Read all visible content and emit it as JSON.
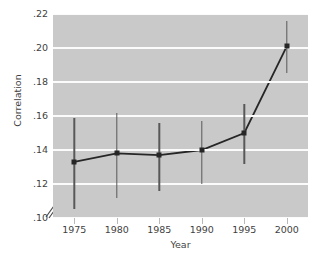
{
  "chart_data": {
    "type": "line",
    "title": "",
    "xlabel": "Year",
    "ylabel": "Correlation",
    "x": [
      1975,
      1980,
      1985,
      1990,
      1995,
      2000
    ],
    "xticklabels": [
      "1975",
      "1980",
      "1985",
      "1990",
      "1995",
      "2000"
    ],
    "yticks": [
      0.1,
      0.12,
      0.14,
      0.16,
      0.18,
      0.2,
      0.22
    ],
    "yticklabels": [
      ".10",
      ".12",
      ".14",
      ".16",
      ".18",
      ".20",
      ".22"
    ],
    "xlim": [
      1972.5,
      2002.5
    ],
    "ylim": [
      0.1,
      0.22
    ],
    "grid": "horizontal",
    "legend": "none",
    "axis_break": "y-axis break below .10",
    "series": [
      {
        "name": "Correlation",
        "marker": "square",
        "color": "#262626",
        "values": [
          0.133,
          0.138,
          0.137,
          0.14,
          0.15,
          0.201
        ],
        "error_low": [
          0.105,
          0.112,
          0.116,
          0.12,
          0.132,
          0.185
        ],
        "error_high": [
          0.159,
          0.162,
          0.156,
          0.157,
          0.167,
          0.216
        ]
      }
    ],
    "panel_color": "#c9c9c9",
    "gridline_color": "#fbfbfb",
    "error_bar_color": "#585858"
  }
}
